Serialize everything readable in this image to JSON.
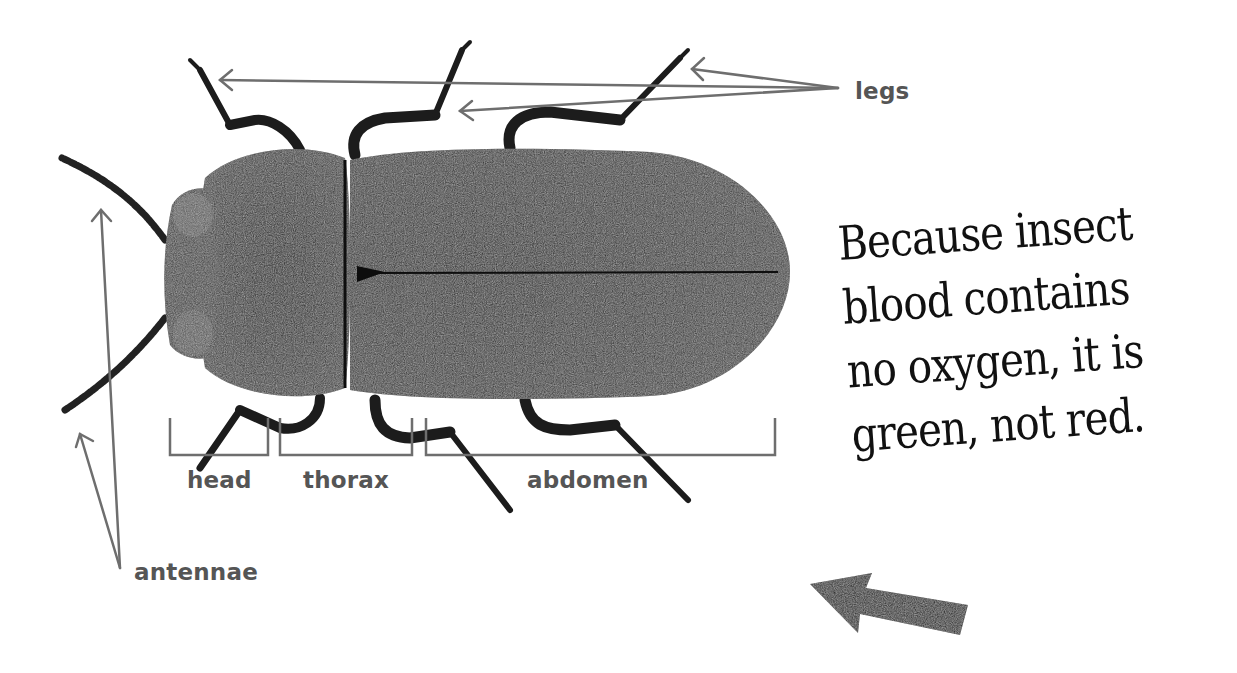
{
  "diagram": {
    "labels": {
      "legs": "legs",
      "antennae": "antennae",
      "head": "head",
      "thorax": "thorax",
      "abdomen": "abdomen"
    },
    "fact": {
      "lines": [
        "Because insect",
        "blood contains",
        "no oxygen, it is",
        "green, not red."
      ]
    },
    "colors": {
      "label_text": "#555555",
      "pointer_line": "#6e6e6e",
      "beetle_body": "#2a2a2a",
      "fact_text": "#111111",
      "arrow": "#1e1e1e"
    },
    "icons": {
      "fact_arrow": "left-arrow-icon"
    }
  }
}
